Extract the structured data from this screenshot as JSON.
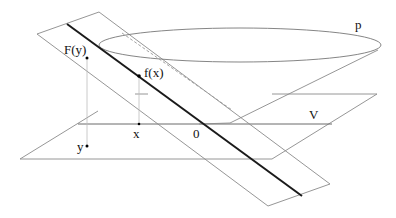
{
  "diagram": {
    "labels": {
      "F_y": "F(y)",
      "f_x": "f(x)",
      "p": "p",
      "V": "V",
      "x": "x",
      "y": "y",
      "origin": "0"
    },
    "colors": {
      "thin_line": "#8a8a8a",
      "bold_line": "#1a1a1a",
      "dashed_line": "#9a9a9a",
      "point": "#000000"
    }
  }
}
